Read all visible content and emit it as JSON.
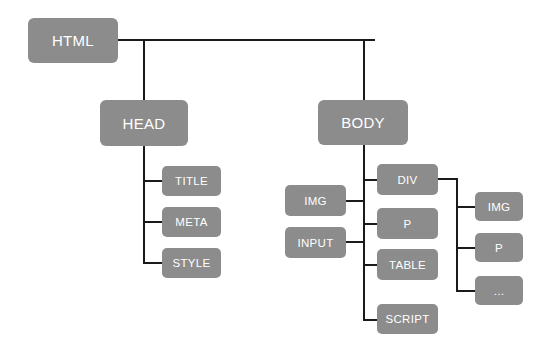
{
  "diagram": {
    "type": "tree",
    "colors": {
      "node_fill": "#8c8c8c",
      "node_text": "#ffffff",
      "connector": "#1a1a1a",
      "background": "#ffffff"
    },
    "nodes": {
      "html": "HTML",
      "head": "HEAD",
      "body": "BODY",
      "head_children": [
        "TITLE",
        "META",
        "STYLE"
      ],
      "body_children_right": [
        "DIV",
        "P",
        "TABLE",
        "SCRIPT"
      ],
      "body_children_left": [
        "IMG",
        "INPUT"
      ],
      "div_children": [
        "IMG",
        "P",
        "..."
      ]
    },
    "edges": [
      [
        "HTML",
        "HEAD"
      ],
      [
        "HTML",
        "BODY"
      ],
      [
        "HEAD",
        "TITLE"
      ],
      [
        "HEAD",
        "META"
      ],
      [
        "HEAD",
        "STYLE"
      ],
      [
        "BODY",
        "DIV"
      ],
      [
        "BODY",
        "P"
      ],
      [
        "BODY",
        "TABLE"
      ],
      [
        "BODY",
        "SCRIPT"
      ],
      [
        "BODY",
        "IMG"
      ],
      [
        "BODY",
        "INPUT"
      ],
      [
        "DIV",
        "IMG"
      ],
      [
        "DIV",
        "P"
      ],
      [
        "DIV",
        "..."
      ]
    ]
  }
}
